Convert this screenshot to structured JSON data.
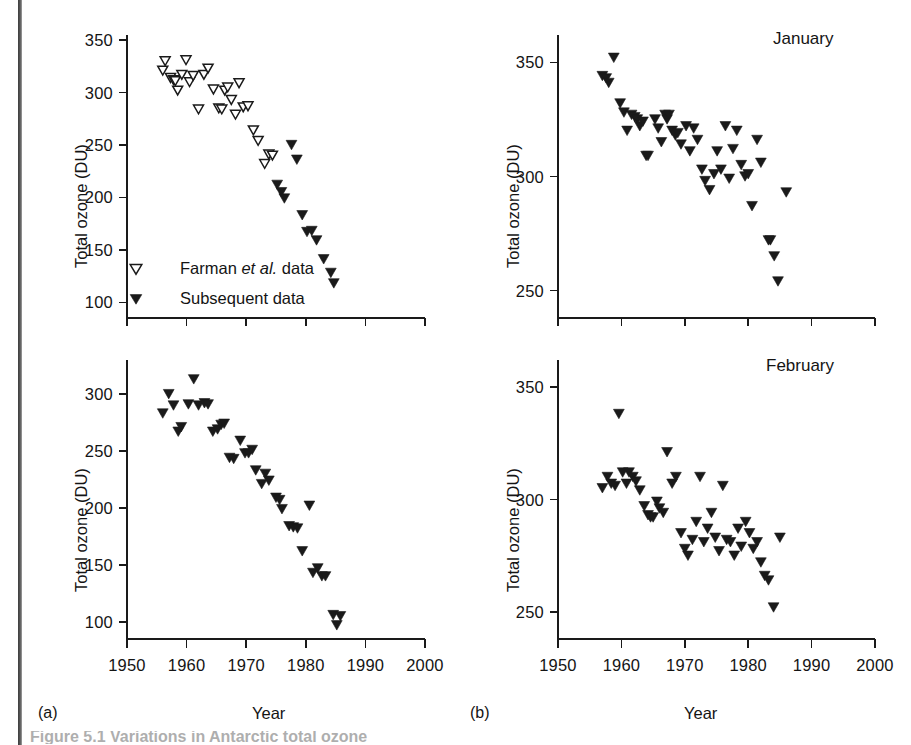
{
  "figure": {
    "caption_partial": "Figure 5.1  Variations in Antarctic total ozone",
    "panel_labels": {
      "a": "(a)",
      "b": "(b)"
    },
    "colors": {
      "ink": "#1a1a1a",
      "marker_fill": "#1a1a1a",
      "marker_open_fill": "#ffffff"
    }
  },
  "legend": {
    "items": [
      {
        "label_prefix": "Farman ",
        "label_italic": "et al.",
        "label_suffix": " data",
        "marker": "open-down-triangle"
      },
      {
        "label_prefix": "Subsequent data",
        "label_italic": "",
        "label_suffix": "",
        "marker": "filled-down-triangle"
      }
    ]
  },
  "chart_data": [
    {
      "id": "panel-a-top",
      "type": "scatter",
      "title": "",
      "xlabel": "",
      "ylabel": "Total ozone (DU)",
      "xlim": [
        1950,
        2000
      ],
      "ylim": [
        85,
        355
      ],
      "xticks": [
        1950,
        1960,
        1970,
        1980,
        1990,
        2000
      ],
      "xticklabels": [
        "",
        "",
        "",
        "",
        "",
        ""
      ],
      "yticks": [
        100,
        150,
        200,
        250,
        300,
        350
      ],
      "yticklabels": [
        "100",
        "150",
        "200",
        "250",
        "300",
        "350"
      ],
      "grid": false,
      "legend_position": "lower-left",
      "series": [
        {
          "name": "Farman et al. data",
          "marker": "open-down-triangle",
          "points": [
            [
              1956.0,
              321
            ],
            [
              1956.4,
              330
            ],
            [
              1957.3,
              314
            ],
            [
              1957.8,
              312
            ],
            [
              1958.1,
              311
            ],
            [
              1958.5,
              302
            ],
            [
              1959.2,
              317
            ],
            [
              1959.9,
              331
            ],
            [
              1960.5,
              310
            ],
            [
              1961.1,
              316
            ],
            [
              1962.0,
              284
            ],
            [
              1962.9,
              317
            ],
            [
              1963.6,
              323
            ],
            [
              1964.5,
              303
            ],
            [
              1965.4,
              285
            ],
            [
              1965.9,
              284
            ],
            [
              1966.4,
              302
            ],
            [
              1966.9,
              305
            ],
            [
              1967.5,
              293
            ],
            [
              1968.2,
              279
            ],
            [
              1968.8,
              309
            ],
            [
              1969.5,
              286
            ],
            [
              1970.3,
              287
            ],
            [
              1971.2,
              264
            ],
            [
              1972.0,
              254
            ],
            [
              1973.1,
              232
            ],
            [
              1973.8,
              241
            ],
            [
              1974.4,
              240
            ]
          ]
        },
        {
          "name": "Subsequent data",
          "marker": "filled-down-triangle",
          "points": [
            [
              1975.2,
              212
            ],
            [
              1975.9,
              205
            ],
            [
              1976.4,
              199
            ],
            [
              1977.6,
              250
            ],
            [
              1978.5,
              236
            ],
            [
              1979.4,
              183
            ],
            [
              1980.2,
              167
            ],
            [
              1981.0,
              168
            ],
            [
              1981.8,
              159
            ],
            [
              1983.0,
              141
            ],
            [
              1984.2,
              128
            ],
            [
              1984.7,
              118
            ]
          ]
        }
      ]
    },
    {
      "id": "panel-a-bottom",
      "type": "scatter",
      "title": "",
      "xlabel": "Year",
      "ylabel": "Total ozone (DU)",
      "xlim": [
        1950,
        2000
      ],
      "ylim": [
        85,
        330
      ],
      "xticks": [
        1950,
        1960,
        1970,
        1980,
        1990,
        2000
      ],
      "xticklabels": [
        "1950",
        "1960",
        "1970",
        "1980",
        "1990",
        "2000"
      ],
      "yticks": [
        100,
        150,
        200,
        250,
        300
      ],
      "yticklabels": [
        "100",
        "150",
        "200",
        "250",
        "300"
      ],
      "grid": false,
      "legend_position": "none",
      "series": [
        {
          "name": "Subsequent data",
          "marker": "filled-down-triangle",
          "points": [
            [
              1956.0,
              283
            ],
            [
              1957.0,
              300
            ],
            [
              1957.8,
              290
            ],
            [
              1958.6,
              267
            ],
            [
              1959.1,
              271
            ],
            [
              1960.3,
              291
            ],
            [
              1961.2,
              313
            ],
            [
              1962.0,
              290
            ],
            [
              1963.0,
              292
            ],
            [
              1963.6,
              291
            ],
            [
              1964.4,
              267
            ],
            [
              1965.2,
              269
            ],
            [
              1965.8,
              273
            ],
            [
              1966.3,
              274
            ],
            [
              1967.2,
              244
            ],
            [
              1967.9,
              243
            ],
            [
              1969.0,
              259
            ],
            [
              1969.8,
              248
            ],
            [
              1970.4,
              248
            ],
            [
              1971.0,
              251
            ],
            [
              1971.6,
              233
            ],
            [
              1972.6,
              221
            ],
            [
              1973.2,
              230
            ],
            [
              1973.8,
              224
            ],
            [
              1975.0,
              209
            ],
            [
              1975.6,
              207
            ],
            [
              1976.0,
              199
            ],
            [
              1977.2,
              184
            ],
            [
              1977.9,
              183
            ],
            [
              1978.6,
              182
            ],
            [
              1979.4,
              162
            ],
            [
              1980.6,
              202
            ],
            [
              1981.2,
              143
            ],
            [
              1982.0,
              147
            ],
            [
              1982.7,
              140
            ],
            [
              1983.3,
              140
            ],
            [
              1984.6,
              106
            ],
            [
              1985.2,
              97
            ],
            [
              1985.8,
              105
            ]
          ]
        }
      ]
    },
    {
      "id": "panel-b-january",
      "type": "scatter",
      "title": "January",
      "xlabel": "",
      "ylabel": "Total ozone (DU)",
      "xlim": [
        1950,
        2000
      ],
      "ylim": [
        238,
        362
      ],
      "xticks": [
        1950,
        1960,
        1970,
        1980,
        1990,
        2000
      ],
      "xticklabels": [
        "",
        "",
        "",
        "",
        "",
        ""
      ],
      "yticks": [
        250,
        300,
        350
      ],
      "yticklabels": [
        "250",
        "300",
        "350"
      ],
      "grid": false,
      "legend_position": "none",
      "series": [
        {
          "name": "January total ozone",
          "marker": "filled-down-triangle",
          "points": [
            [
              1957.0,
              344
            ],
            [
              1957.6,
              343
            ],
            [
              1958.0,
              341
            ],
            [
              1958.8,
              352
            ],
            [
              1959.8,
              332
            ],
            [
              1960.4,
              328
            ],
            [
              1960.9,
              320
            ],
            [
              1961.6,
              327
            ],
            [
              1962.1,
              326
            ],
            [
              1962.5,
              325
            ],
            [
              1962.9,
              322
            ],
            [
              1963.4,
              324
            ],
            [
              1963.9,
              309
            ],
            [
              1964.2,
              309
            ],
            [
              1965.3,
              325
            ],
            [
              1965.8,
              321
            ],
            [
              1966.3,
              315
            ],
            [
              1966.9,
              327
            ],
            [
              1967.2,
              325
            ],
            [
              1967.5,
              327
            ],
            [
              1968.0,
              320
            ],
            [
              1968.5,
              318
            ],
            [
              1968.9,
              319
            ],
            [
              1969.4,
              314
            ],
            [
              1970.2,
              322
            ],
            [
              1970.8,
              311
            ],
            [
              1971.4,
              321
            ],
            [
              1972.0,
              316
            ],
            [
              1972.7,
              303
            ],
            [
              1973.2,
              298
            ],
            [
              1973.9,
              294
            ],
            [
              1974.6,
              301
            ],
            [
              1975.1,
              311
            ],
            [
              1975.7,
              303
            ],
            [
              1976.4,
              322
            ],
            [
              1977.0,
              299
            ],
            [
              1977.6,
              312
            ],
            [
              1978.2,
              320
            ],
            [
              1978.9,
              305
            ],
            [
              1979.5,
              300
            ],
            [
              1980.0,
              301
            ],
            [
              1980.6,
              287
            ],
            [
              1981.4,
              316
            ],
            [
              1982.0,
              306
            ],
            [
              1983.2,
              272
            ],
            [
              1983.5,
              272
            ],
            [
              1984.1,
              265
            ],
            [
              1984.7,
              254
            ],
            [
              1986.0,
              293
            ]
          ]
        }
      ]
    },
    {
      "id": "panel-b-february",
      "type": "scatter",
      "title": "February",
      "xlabel": "Year",
      "ylabel": "Total ozone (DU)",
      "xlim": [
        1950,
        2000
      ],
      "ylim": [
        238,
        362
      ],
      "xticks": [
        1950,
        1960,
        1970,
        1980,
        1990,
        2000
      ],
      "xticklabels": [
        "1950",
        "1960",
        "1970",
        "1980",
        "1990",
        "2000"
      ],
      "yticks": [
        250,
        300,
        350
      ],
      "yticklabels": [
        "250",
        "300",
        "350"
      ],
      "grid": false,
      "legend_position": "none",
      "series": [
        {
          "name": "February total ozone",
          "marker": "filled-down-triangle",
          "points": [
            [
              1957.0,
              305
            ],
            [
              1957.8,
              310
            ],
            [
              1958.4,
              307
            ],
            [
              1959.0,
              306
            ],
            [
              1959.6,
              338
            ],
            [
              1960.2,
              312
            ],
            [
              1960.8,
              307
            ],
            [
              1961.2,
              312
            ],
            [
              1961.8,
              310
            ],
            [
              1962.3,
              308
            ],
            [
              1962.9,
              304
            ],
            [
              1963.6,
              297
            ],
            [
              1964.2,
              293
            ],
            [
              1964.6,
              292
            ],
            [
              1965.0,
              292
            ],
            [
              1965.6,
              299
            ],
            [
              1966.0,
              296
            ],
            [
              1966.6,
              294
            ],
            [
              1967.2,
              321
            ],
            [
              1968.0,
              307
            ],
            [
              1968.6,
              310
            ],
            [
              1969.4,
              285
            ],
            [
              1970.0,
              278
            ],
            [
              1970.5,
              275
            ],
            [
              1971.2,
              282
            ],
            [
              1971.8,
              290
            ],
            [
              1972.4,
              310
            ],
            [
              1973.0,
              281
            ],
            [
              1973.6,
              287
            ],
            [
              1974.2,
              294
            ],
            [
              1974.8,
              283
            ],
            [
              1975.4,
              277
            ],
            [
              1976.0,
              306
            ],
            [
              1976.6,
              282
            ],
            [
              1977.2,
              281
            ],
            [
              1977.8,
              275
            ],
            [
              1978.4,
              287
            ],
            [
              1978.9,
              279
            ],
            [
              1979.6,
              290
            ],
            [
              1980.2,
              285
            ],
            [
              1980.8,
              278
            ],
            [
              1981.4,
              281
            ],
            [
              1982.0,
              272
            ],
            [
              1982.6,
              266
            ],
            [
              1983.2,
              264
            ],
            [
              1984.0,
              252
            ],
            [
              1985.0,
              283
            ]
          ]
        }
      ]
    }
  ]
}
